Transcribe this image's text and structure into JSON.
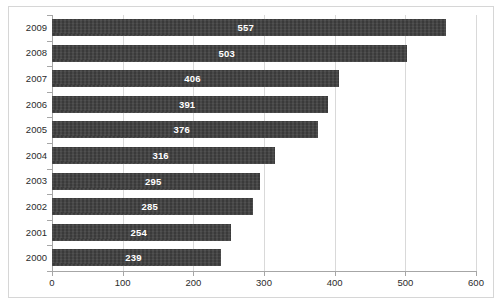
{
  "chart_data": {
    "type": "bar",
    "orientation": "horizontal",
    "title": "",
    "subtitle": "",
    "xlabel": "",
    "ylabel": "",
    "categories": [
      "2009",
      "2008",
      "2007",
      "2006",
      "2005",
      "2004",
      "2003",
      "2002",
      "2001",
      "2000"
    ],
    "values": [
      557,
      503,
      406,
      391,
      376,
      316,
      295,
      285,
      254,
      239
    ],
    "data_labels": [
      "557",
      "503",
      "406",
      "391",
      "376",
      "316",
      "295",
      "285",
      "254",
      "239"
    ],
    "xlim": [
      0,
      600
    ],
    "xticks": [
      0,
      100,
      200,
      300,
      400,
      500,
      600
    ],
    "xtick_labels": [
      "0",
      "100",
      "200",
      "300",
      "400",
      "500",
      "600"
    ],
    "grid": true,
    "grid_axis": "x",
    "legend": false,
    "legend_position": "none",
    "series": [
      {
        "name": "",
        "values": [
          557,
          503,
          406,
          391,
          376,
          316,
          295,
          285,
          254,
          239
        ]
      }
    ],
    "colors": {
      "bar": "#3f3f3f",
      "data_label": "#ffffff",
      "gridline": "#d9d9d9",
      "axis": "#a6a6a6",
      "border": "#d6d6d6",
      "background": "#ffffff",
      "tick_label": "#2b2b2b"
    }
  }
}
